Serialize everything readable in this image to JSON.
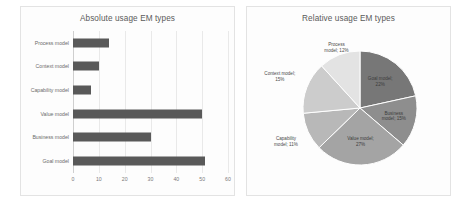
{
  "figure": {
    "background": "#ffffff"
  },
  "bar_panel": {
    "title": "Absolute usage EM types"
  },
  "pie_panel": {
    "title": "Relative usage EM types"
  },
  "chart_data": [
    {
      "type": "bar",
      "orientation": "horizontal",
      "title": "Absolute usage EM types",
      "xlabel": "",
      "ylabel": "",
      "categories": [
        "Process model",
        "Context model",
        "Capability model",
        "Value model",
        "Business model",
        "Goal model"
      ],
      "values": [
        14,
        10,
        7,
        50,
        30,
        51
      ],
      "xlim": [
        0,
        60
      ],
      "xticks": [
        0,
        10,
        20,
        30,
        40,
        50,
        60
      ],
      "xtick_labels": [
        "0",
        "10",
        "20",
        "30",
        "40",
        "50",
        "60"
      ],
      "grid": true,
      "legend": "none",
      "series_color": "#595959"
    },
    {
      "type": "pie",
      "title": "Relative usage EM types",
      "labels": [
        "Goal model",
        "Business model",
        "Value model",
        "Capability model",
        "Context model",
        "Process model"
      ],
      "values": [
        22,
        15,
        27,
        11,
        15,
        12
      ],
      "label_texts": [
        "Goal model;\n22%",
        "Business\nmodel; 15%",
        "Value model;\n27%",
        "Capability\nmodel; 11%",
        "Context model;\n15%",
        "Process\nmodel; 12%"
      ],
      "colors": [
        "#777777",
        "#8e8e8e",
        "#a4a4a4",
        "#b8b8b8",
        "#cccccc",
        "#e3e3e3"
      ],
      "legend": "none",
      "start_angle_deg": 0,
      "direction": "clockwise"
    }
  ],
  "pie_labels": [
    {
      "text1": "Goal model;",
      "text2": "22%"
    },
    {
      "text1": "Business",
      "text2": "model; 15%"
    },
    {
      "text1": "Value model;",
      "text2": "27%"
    },
    {
      "text1": "Capability",
      "text2": "model; 11%"
    },
    {
      "text1": "Context model;",
      "text2": "15%"
    },
    {
      "text1": "Process",
      "text2": "model; 12%"
    }
  ],
  "bar_categories": [
    {
      "label": "Process model",
      "value": 14
    },
    {
      "label": "Context model",
      "value": 10
    },
    {
      "label": "Capability model",
      "value": 7
    },
    {
      "label": "Value model",
      "value": 50
    },
    {
      "label": "Business model",
      "value": 30
    },
    {
      "label": "Goal model",
      "value": 51
    }
  ],
  "xticks": [
    {
      "label": "0"
    },
    {
      "label": "10"
    },
    {
      "label": "20"
    },
    {
      "label": "30"
    },
    {
      "label": "40"
    },
    {
      "label": "50"
    },
    {
      "label": "60"
    }
  ]
}
